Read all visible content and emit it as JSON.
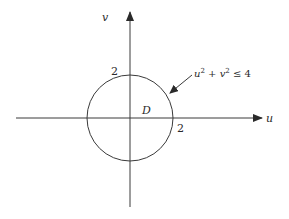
{
  "diagram": {
    "type": "coordinate-plane-region",
    "axes": {
      "horizontal": {
        "label": "u",
        "from": [
          16,
          118
        ],
        "to": [
          262,
          118
        ]
      },
      "vertical": {
        "label": "v",
        "from": [
          130,
          207
        ],
        "to": [
          130,
          12
        ]
      }
    },
    "circle": {
      "cx": 130,
      "cy": 118,
      "r": 43
    },
    "tick_labels": {
      "u_axis": "2",
      "v_axis": "2"
    },
    "region_label": "D",
    "inequality": {
      "base_u": "u",
      "exp_u": "2",
      "plus": " + ",
      "base_v": "v",
      "exp_v": "2",
      "rel": " ≤ 4"
    },
    "pointer_arrow": {
      "from": [
        192,
        75
      ],
      "to": [
        170,
        93
      ]
    },
    "colors": {
      "stroke": "#3a3a3a",
      "text": "#2a2a2a",
      "background": "#ffffff"
    }
  }
}
